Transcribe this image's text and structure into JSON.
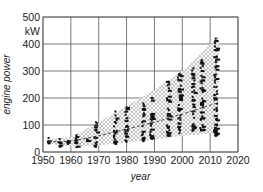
{
  "chart_data": {
    "type": "scatter",
    "title": "",
    "xlabel": "year",
    "ylabel": "engine power",
    "y_unit": "kW",
    "xlim": [
      1950,
      2020
    ],
    "ylim": [
      0,
      500
    ],
    "x_ticks": [
      1950,
      1960,
      1970,
      1980,
      1990,
      2000,
      2010,
      2020
    ],
    "y_ticks": [
      0,
      100,
      200,
      300,
      400,
      500
    ],
    "x_tick_labels": [
      "1950",
      "1960",
      "1970",
      "1980",
      "1990",
      "2000",
      "2010",
      "2020"
    ],
    "y_tick_labels": [
      "0",
      "100",
      "200",
      "300",
      "400",
      "500"
    ],
    "grid": true,
    "envelope": {
      "description": "hatched range of engine power over time",
      "upper": [
        [
          1953,
          50
        ],
        [
          1960,
          55
        ],
        [
          1970,
          110
        ],
        [
          1980,
          170
        ],
        [
          1990,
          230
        ],
        [
          2000,
          300
        ],
        [
          2013,
          430
        ]
      ],
      "lower": [
        [
          2013,
          70
        ],
        [
          2000,
          60
        ],
        [
          1990,
          45
        ],
        [
          1980,
          35
        ],
        [
          1970,
          25
        ],
        [
          1960,
          20
        ],
        [
          1953,
          30
        ]
      ]
    },
    "trend": {
      "style": "dashed",
      "points": [
        [
          1952,
          38
        ],
        [
          1960,
          40
        ],
        [
          1970,
          60
        ],
        [
          1980,
          85
        ],
        [
          1990,
          110
        ],
        [
          2000,
          140
        ],
        [
          2012,
          180
        ]
      ]
    },
    "clusters": [
      {
        "year": 1952,
        "min": 32,
        "max": 52
      },
      {
        "year": 1956,
        "min": 20,
        "max": 48
      },
      {
        "year": 1959,
        "min": 30,
        "max": 40
      },
      {
        "year": 1962,
        "min": 18,
        "max": 62
      },
      {
        "year": 1966,
        "min": 40,
        "max": 46
      },
      {
        "year": 1969,
        "min": 20,
        "max": 110
      },
      {
        "year": 1976,
        "min": 30,
        "max": 150
      },
      {
        "year": 1980,
        "min": 38,
        "max": 165
      },
      {
        "year": 1986,
        "min": 40,
        "max": 180
      },
      {
        "year": 1989,
        "min": 50,
        "max": 200
      },
      {
        "year": 1995,
        "min": 60,
        "max": 260
      },
      {
        "year": 1999,
        "min": 70,
        "max": 290
      },
      {
        "year": 2004,
        "min": 80,
        "max": 310
      },
      {
        "year": 2007,
        "min": 80,
        "max": 340
      },
      {
        "year": 2012,
        "min": 60,
        "max": 420
      }
    ]
  }
}
